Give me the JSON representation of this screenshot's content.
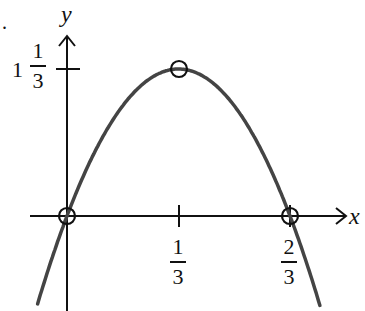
{
  "chart_data": {
    "type": "line",
    "title": "",
    "function": "y = 12x(2/3 - x) = 8x - 12x^2",
    "xlabel": "x",
    "ylabel": "y",
    "x_ticks": [
      {
        "value": 0.3333,
        "numerator": "1",
        "denominator": "3"
      },
      {
        "value": 0.6667,
        "numerator": "2",
        "denominator": "3"
      }
    ],
    "y_ticks": [
      {
        "value": 1.3333,
        "whole": "1",
        "numerator": "1",
        "denominator": "3"
      }
    ],
    "marked_points": [
      {
        "x": 0,
        "y": 0,
        "label": "root"
      },
      {
        "x": 0.3333,
        "y": 1.3333,
        "label": "vertex"
      },
      {
        "x": 0.6667,
        "y": 0,
        "label": "root"
      }
    ],
    "series": [
      {
        "name": "parabola",
        "x": [
          -0.09,
          0,
          0.1667,
          0.3333,
          0.5,
          0.6667,
          0.76
        ],
        "y": [
          -0.82,
          0,
          1.0,
          1.3333,
          1.0,
          0,
          -0.85
        ]
      }
    ],
    "curve_color": "#444444",
    "axis_color": "#111111",
    "grid": false,
    "legend": null
  },
  "labels": {
    "x_axis": "x",
    "y_axis": "y",
    "xtick1_num": "1",
    "xtick1_den": "3",
    "xtick2_num": "2",
    "xtick2_den": "3",
    "ytick_whole": "1",
    "ytick_num": "1",
    "ytick_den": "3",
    "corner_mark": "."
  }
}
